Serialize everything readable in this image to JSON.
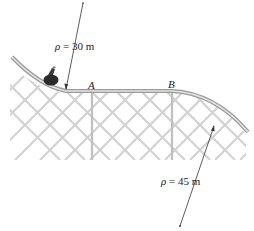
{
  "figure": {
    "points": [
      {
        "id": "A",
        "label": "A"
      },
      {
        "id": "B",
        "label": "B"
      }
    ],
    "radii": [
      {
        "symbol": "ρ",
        "text": "= 30 m",
        "value": 30,
        "unit": "m",
        "location": "curve before A (concave up)"
      },
      {
        "symbol": "ρ",
        "text": "= 45 m",
        "value": 45,
        "unit": "m",
        "location": "curve after B (concave down)"
      }
    ],
    "colors": {
      "track": "#bdbdbd",
      "track_edge": "#8f8f8f",
      "lattice": "#cfcfcf",
      "arrow": "#333333",
      "car": "#2b2b2b"
    }
  }
}
